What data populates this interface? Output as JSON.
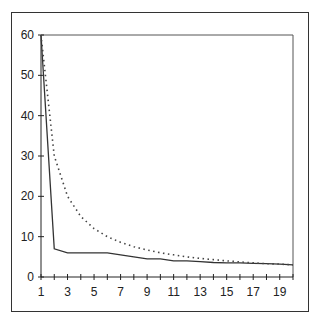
{
  "chart_data": {
    "type": "line",
    "title": "",
    "xlabel": "",
    "ylabel": "",
    "x": [
      1,
      2,
      3,
      4,
      5,
      6,
      7,
      8,
      9,
      10,
      11,
      12,
      13,
      14,
      15,
      16,
      17,
      18,
      19,
      20
    ],
    "xticks_labels": [
      "1",
      "3",
      "5",
      "7",
      "9",
      "11",
      "13",
      "15",
      "17",
      "19"
    ],
    "yticks_labels": [
      "0",
      "10",
      "20",
      "30",
      "40",
      "50",
      "60"
    ],
    "xlim": [
      1,
      20
    ],
    "ylim": [
      0,
      60
    ],
    "grid": false,
    "legend": null,
    "series": [
      {
        "name": "solid",
        "style": "solid",
        "color": "#333333",
        "values": [
          60,
          7,
          6,
          6,
          6,
          6,
          5.5,
          5,
          4.5,
          4.5,
          4,
          4,
          3.8,
          3.6,
          3.5,
          3.5,
          3.4,
          3.3,
          3.2,
          3.0
        ]
      },
      {
        "name": "dotted",
        "style": "dotted",
        "color": "#444444",
        "values": [
          60,
          30,
          20,
          15,
          12,
          10,
          8.6,
          7.5,
          6.7,
          6,
          5.5,
          5,
          4.6,
          4.3,
          4,
          3.75,
          3.5,
          3.3,
          3.2,
          3.0
        ]
      }
    ]
  }
}
